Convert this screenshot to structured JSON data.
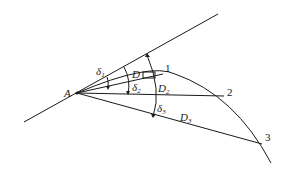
{
  "diagram": {
    "type": "geometry",
    "points": [
      {
        "id": "A",
        "label": "A"
      },
      {
        "id": "P1",
        "label": "1"
      },
      {
        "id": "P2",
        "label": "2"
      },
      {
        "id": "P3",
        "label": "3"
      }
    ],
    "angles": [
      {
        "symbol": "δ",
        "sub": "1"
      },
      {
        "symbol": "δ",
        "sub": "2"
      },
      {
        "symbol": "δ",
        "sub": "3"
      }
    ],
    "chords": [
      {
        "symbol": "D",
        "sub": ""
      },
      {
        "symbol": "D",
        "sub": "2"
      },
      {
        "symbol": "D",
        "sub": "3"
      }
    ]
  }
}
